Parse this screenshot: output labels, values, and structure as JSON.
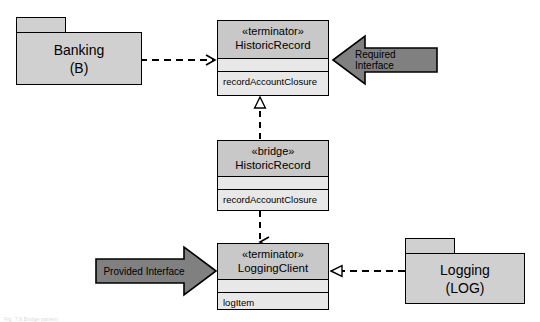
{
  "diagram": {
    "type": "uml-component-bridge-diagram",
    "background": "#ffffff",
    "colors": {
      "package_fill": "#d0d0d0",
      "header_fill": "#c8c8c8",
      "compartment_fill": "#e8e8e8",
      "arrow_fill": "#808080",
      "line": "#000000"
    }
  },
  "packages": [
    {
      "id": "banking",
      "name_line1": "Banking",
      "name_line2": "(B)"
    },
    {
      "id": "logging",
      "name_line1": "Logging",
      "name_line2": "(LOG)"
    }
  ],
  "classifiers": [
    {
      "id": "historic-record-terminator",
      "stereotype": "«terminator»",
      "name": "HistoricRecord",
      "attributes": "",
      "operations": "recordAccountClosure"
    },
    {
      "id": "historic-record-bridge",
      "stereotype": "«bridge»",
      "name": "HistoricRecord",
      "attributes": "",
      "operations": "recordAccountClosure"
    },
    {
      "id": "logging-client-terminator",
      "stereotype": "«terminator»",
      "name": "LoggingClient",
      "attributes": "",
      "operations": "logItem"
    }
  ],
  "annotations": [
    {
      "id": "required-interface",
      "label": "Required Interface",
      "direction": "left"
    },
    {
      "id": "provided-interface",
      "label": "Provided Interface",
      "direction": "right"
    }
  ],
  "connectors": [
    {
      "id": "banking-to-historic-record",
      "style": "dashed",
      "arrowhead": "open",
      "from": "banking",
      "to": "historic-record-terminator"
    },
    {
      "id": "bridge-realizes-historic-record",
      "style": "dashed",
      "arrowhead": "hollow-triangle",
      "from": "historic-record-bridge",
      "to": "historic-record-terminator"
    },
    {
      "id": "bridge-to-logging-client",
      "style": "dashed",
      "arrowhead": "open",
      "from": "historic-record-bridge",
      "to": "logging-client-terminator"
    },
    {
      "id": "logging-realizes-logging-client",
      "style": "dashed",
      "arrowhead": "hollow-triangle",
      "from": "logging",
      "to": "logging-client-terminator"
    }
  ],
  "caption": "Fig. 7.9  Bridge pattern"
}
